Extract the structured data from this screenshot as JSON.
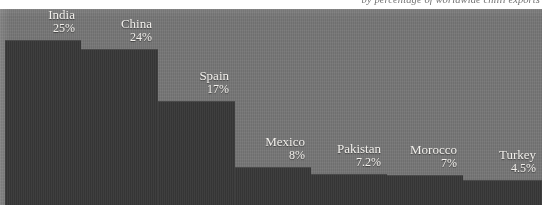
{
  "caption": {
    "text": "by percentage of worldwide chilli exports"
  },
  "colors": {
    "panel_background": "#767676",
    "bar_fill": "#383838",
    "label_text": "#f2f0ec",
    "caption_text": "#5d5d5d"
  },
  "chart_data": {
    "type": "bar",
    "title": "by percentage of worldwide chilli exports",
    "xlabel": "",
    "ylabel": "",
    "ylim": [
      0,
      25
    ],
    "grid": false,
    "legend": "none",
    "categories": [
      "India",
      "China",
      "Spain",
      "Mexico",
      "Pakistan",
      "Morocco",
      "Turkey"
    ],
    "values": [
      25,
      24,
      17,
      8,
      7.2,
      7,
      4.5
    ],
    "value_labels": [
      "25%",
      "24%",
      "17%",
      "8%",
      "7.2%",
      "7%",
      "4.5%"
    ],
    "bars": [
      {
        "name": "India",
        "value": 25,
        "label": "25%",
        "x": 5,
        "width": 76,
        "top": 40
      },
      {
        "name": "China",
        "value": 24,
        "label": "24%",
        "x": 81,
        "width": 77,
        "top": 49
      },
      {
        "name": "Spain",
        "value": 17,
        "label": "17%",
        "x": 158,
        "width": 77,
        "top": 101
      },
      {
        "name": "Mexico",
        "value": 8,
        "label": "8%",
        "x": 235,
        "width": 76,
        "top": 167
      },
      {
        "name": "Pakistan",
        "value": 7.2,
        "label": "7.2%",
        "x": 311,
        "width": 76,
        "top": 174
      },
      {
        "name": "Morocco",
        "value": 7,
        "label": "7%",
        "x": 387,
        "width": 76,
        "top": 175
      },
      {
        "name": "Turkey",
        "value": 4.5,
        "label": "4.5%",
        "x": 463,
        "width": 79,
        "top": 180
      }
    ]
  }
}
